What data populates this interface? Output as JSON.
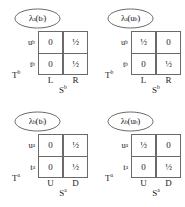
{
  "figure": {
    "type": "belief-matrix-grid",
    "rows": 2,
    "cols": 2,
    "line_color": "#6a6a6a",
    "text_color": "#1a1a1a",
    "background": "#ffffff"
  },
  "panels": [
    {
      "id": "panel-lambda-a-tb",
      "label_lambda": "λ",
      "label_lambda_sup": "a",
      "label_arg": "t",
      "label_arg_sup": "b",
      "label_text": "λa(tb)",
      "row_group": "T",
      "row_group_sup": "b",
      "row_labels": [
        {
          "base": "u",
          "sup": "b"
        },
        {
          "base": "t",
          "sup": "b"
        }
      ],
      "col_group": "S",
      "col_group_sup": "b",
      "col_labels": [
        "L",
        "R"
      ],
      "values": [
        [
          "0",
          "½"
        ],
        [
          "0",
          "½"
        ]
      ]
    },
    {
      "id": "panel-lambda-a-ub",
      "label_lambda": "λ",
      "label_lambda_sup": "a",
      "label_arg": "u",
      "label_arg_sup": "b",
      "label_text": "λa(ub)",
      "row_group": "T",
      "row_group_sup": "b",
      "row_labels": [
        {
          "base": "u",
          "sup": "b"
        },
        {
          "base": "t",
          "sup": "b"
        }
      ],
      "col_group": "S",
      "col_group_sup": "b",
      "col_labels": [
        "L",
        "R"
      ],
      "values": [
        [
          "½",
          "0"
        ],
        [
          "0",
          "½"
        ]
      ]
    },
    {
      "id": "panel-lambda-b-tb",
      "label_lambda": "λ",
      "label_lambda_sup": "b",
      "label_arg": "t",
      "label_arg_sup": "b",
      "label_text": "λb(tb)",
      "row_group": "T",
      "row_group_sup": "a",
      "row_labels": [
        {
          "base": "u",
          "sup": "a"
        },
        {
          "base": "t",
          "sup": "a"
        }
      ],
      "col_group": "S",
      "col_group_sup": "a",
      "col_labels": [
        "U",
        "D"
      ],
      "values": [
        [
          "0",
          "½"
        ],
        [
          "0",
          "½"
        ]
      ]
    },
    {
      "id": "panel-lambda-b-ub",
      "label_lambda": "λ",
      "label_lambda_sup": "b",
      "label_arg": "u",
      "label_arg_sup": "b",
      "label_text": "λb(ub)",
      "row_group": "T",
      "row_group_sup": "a",
      "row_labels": [
        {
          "base": "u",
          "sup": "a"
        },
        {
          "base": "t",
          "sup": "a"
        }
      ],
      "col_group": "S",
      "col_group_sup": "a",
      "col_labels": [
        "U",
        "D"
      ],
      "values": [
        [
          "½",
          "0"
        ],
        [
          "0",
          "½"
        ]
      ]
    }
  ]
}
